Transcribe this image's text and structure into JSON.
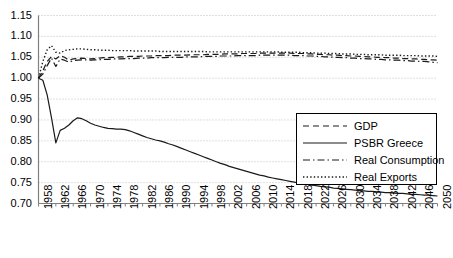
{
  "chart_data": {
    "type": "line",
    "title": "",
    "xlabel": "",
    "ylabel": "",
    "xlim": [
      1958,
      2050
    ],
    "ylim": [
      0.7,
      1.15
    ],
    "grid": true,
    "legend_position": "inside-right",
    "ytick_labels": [
      "1.15",
      "1.10",
      "1.05",
      "1.00",
      "0.95",
      "0.90",
      "0.85",
      "0.80",
      "0.75",
      "0.70"
    ],
    "ytick_values": [
      1.15,
      1.1,
      1.05,
      1.0,
      0.95,
      0.9,
      0.85,
      0.8,
      0.75,
      0.7
    ],
    "xtick_labels": [
      "1958",
      "1962",
      "1966",
      "1970",
      "1974",
      "1978",
      "1982",
      "1986",
      "1990",
      "1994",
      "1998",
      "2002",
      "2006",
      "2010",
      "2014",
      "2018",
      "2022",
      "2026",
      "2030",
      "2034",
      "2038",
      "2042",
      "2046",
      "2050"
    ],
    "xtick_values": [
      1958,
      1962,
      1966,
      1970,
      1974,
      1978,
      1982,
      1986,
      1990,
      1994,
      1998,
      2002,
      2006,
      2010,
      2014,
      2018,
      2022,
      2026,
      2030,
      2034,
      2038,
      2042,
      2046,
      2050
    ],
    "x": [
      1958,
      1959,
      1960,
      1961,
      1962,
      1963,
      1964,
      1965,
      1966,
      1967,
      1968,
      1969,
      1970,
      1971,
      1972,
      1973,
      1974,
      1975,
      1976,
      1977,
      1978,
      1979,
      1980,
      1981,
      1982,
      1983,
      1984,
      1985,
      1986,
      1987,
      1988,
      1989,
      1990,
      1991,
      1992,
      1993,
      1994,
      1995,
      1996,
      1997,
      1998,
      1999,
      2000,
      2001,
      2002,
      2003,
      2004,
      2005,
      2006,
      2007,
      2008,
      2009,
      2010,
      2011,
      2012,
      2013,
      2014,
      2015,
      2016,
      2017,
      2018,
      2019,
      2020,
      2021,
      2022,
      2023,
      2024,
      2025,
      2026,
      2027,
      2028,
      2029,
      2030,
      2031,
      2032,
      2033,
      2034,
      2035,
      2036,
      2037,
      2038,
      2039,
      2040,
      2041,
      2042,
      2043,
      2044,
      2045,
      2046,
      2047,
      2048,
      2049,
      2050
    ],
    "series": [
      {
        "name": "GDP",
        "line_style": "dashed",
        "color": "#1a1a1a",
        "values": [
          1.0,
          1.018,
          1.04,
          1.052,
          1.046,
          1.054,
          1.05,
          1.043,
          1.046,
          1.047,
          1.048,
          1.047,
          1.046,
          1.047,
          1.048,
          1.049,
          1.049,
          1.05,
          1.05,
          1.051,
          1.051,
          1.052,
          1.052,
          1.052,
          1.053,
          1.053,
          1.053,
          1.054,
          1.054,
          1.054,
          1.054,
          1.055,
          1.055,
          1.055,
          1.055,
          1.056,
          1.056,
          1.056,
          1.056,
          1.057,
          1.057,
          1.057,
          1.057,
          1.058,
          1.058,
          1.058,
          1.058,
          1.059,
          1.059,
          1.059,
          1.059,
          1.06,
          1.06,
          1.06,
          1.06,
          1.06,
          1.06,
          1.06,
          1.06,
          1.059,
          1.059,
          1.059,
          1.058,
          1.058,
          1.057,
          1.057,
          1.056,
          1.056,
          1.055,
          1.055,
          1.054,
          1.054,
          1.053,
          1.053,
          1.052,
          1.052,
          1.051,
          1.051,
          1.05,
          1.05,
          1.049,
          1.049,
          1.048,
          1.048,
          1.047,
          1.047,
          1.046,
          1.046,
          1.045,
          1.045,
          1.044,
          1.044,
          1.043
        ]
      },
      {
        "name": "PSBR Greece",
        "line_style": "solid",
        "color": "#1a1a1a",
        "values": [
          1.0,
          0.995,
          0.96,
          0.905,
          0.845,
          0.875,
          0.88,
          0.888,
          0.898,
          0.905,
          0.903,
          0.898,
          0.892,
          0.888,
          0.885,
          0.882,
          0.88,
          0.879,
          0.878,
          0.878,
          0.877,
          0.874,
          0.87,
          0.866,
          0.862,
          0.858,
          0.855,
          0.852,
          0.85,
          0.847,
          0.843,
          0.84,
          0.836,
          0.832,
          0.828,
          0.824,
          0.82,
          0.816,
          0.812,
          0.808,
          0.804,
          0.8,
          0.796,
          0.793,
          0.789,
          0.786,
          0.783,
          0.78,
          0.777,
          0.774,
          0.771,
          0.768,
          0.766,
          0.763,
          0.761,
          0.759,
          0.757,
          0.755,
          0.753,
          0.751,
          0.749,
          0.747,
          0.746,
          0.744,
          0.743,
          0.741,
          0.74,
          0.739,
          0.737,
          0.736,
          0.735,
          0.734,
          0.733,
          0.732,
          0.731,
          0.73,
          0.729,
          0.729,
          0.728,
          0.727,
          0.726,
          0.726,
          0.725,
          0.724,
          0.724,
          0.723,
          0.722,
          0.722,
          0.721,
          0.72,
          0.72,
          0.719,
          0.718
        ]
      },
      {
        "name": "Real Consumption",
        "line_style": "dashdot",
        "color": "#1a1a1a",
        "values": [
          1.0,
          1.01,
          1.03,
          1.048,
          1.028,
          1.046,
          1.043,
          1.038,
          1.042,
          1.043,
          1.044,
          1.044,
          1.043,
          1.044,
          1.044,
          1.045,
          1.045,
          1.046,
          1.046,
          1.046,
          1.047,
          1.047,
          1.047,
          1.048,
          1.048,
          1.048,
          1.049,
          1.049,
          1.049,
          1.049,
          1.05,
          1.05,
          1.05,
          1.05,
          1.051,
          1.051,
          1.051,
          1.051,
          1.052,
          1.052,
          1.052,
          1.052,
          1.053,
          1.053,
          1.053,
          1.053,
          1.054,
          1.054,
          1.054,
          1.054,
          1.054,
          1.055,
          1.055,
          1.055,
          1.055,
          1.055,
          1.055,
          1.055,
          1.055,
          1.054,
          1.054,
          1.054,
          1.053,
          1.053,
          1.052,
          1.052,
          1.051,
          1.051,
          1.05,
          1.05,
          1.049,
          1.049,
          1.048,
          1.048,
          1.047,
          1.047,
          1.046,
          1.046,
          1.045,
          1.045,
          1.044,
          1.044,
          1.043,
          1.043,
          1.042,
          1.042,
          1.041,
          1.041,
          1.04,
          1.04,
          1.039,
          1.038,
          1.037
        ]
      },
      {
        "name": "Real Exports",
        "line_style": "dotted",
        "color": "#1a1a1a",
        "values": [
          1.0,
          1.04,
          1.068,
          1.078,
          1.062,
          1.06,
          1.066,
          1.068,
          1.069,
          1.07,
          1.07,
          1.069,
          1.068,
          1.068,
          1.067,
          1.067,
          1.067,
          1.066,
          1.066,
          1.066,
          1.066,
          1.066,
          1.065,
          1.065,
          1.065,
          1.065,
          1.065,
          1.065,
          1.064,
          1.064,
          1.064,
          1.064,
          1.064,
          1.064,
          1.064,
          1.064,
          1.064,
          1.064,
          1.064,
          1.063,
          1.063,
          1.063,
          1.063,
          1.063,
          1.063,
          1.063,
          1.063,
          1.063,
          1.063,
          1.063,
          1.063,
          1.063,
          1.063,
          1.063,
          1.063,
          1.063,
          1.062,
          1.062,
          1.062,
          1.062,
          1.062,
          1.061,
          1.061,
          1.061,
          1.06,
          1.06,
          1.06,
          1.059,
          1.059,
          1.059,
          1.058,
          1.058,
          1.058,
          1.057,
          1.057,
          1.057,
          1.056,
          1.056,
          1.056,
          1.056,
          1.055,
          1.055,
          1.055,
          1.055,
          1.054,
          1.054,
          1.054,
          1.054,
          1.053,
          1.053,
          1.053,
          1.053,
          1.052
        ]
      }
    ]
  },
  "legend": {
    "items": [
      {
        "label": "GDP"
      },
      {
        "label": "PSBR Greece"
      },
      {
        "label": "Real Consumption"
      },
      {
        "label": "Real Exports"
      }
    ]
  },
  "colors": {
    "line": "#1a1a1a",
    "grid": "#bfbfbf",
    "axis": "#808080",
    "background": "#ffffff"
  }
}
